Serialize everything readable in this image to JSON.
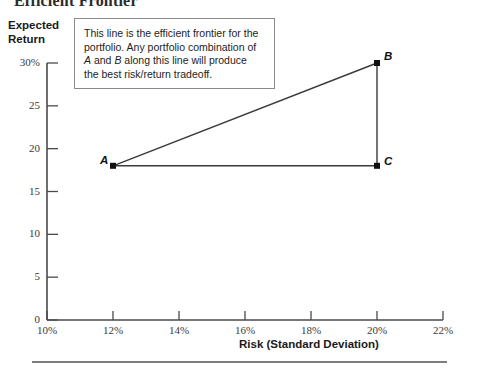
{
  "title": "Efficient Frontier",
  "callout": {
    "lines": [
      "This line is the efficient frontier for the",
      "portfolio. Any portfolio combination of",
      "A and B along this line will produce",
      "the best risk/return tradeoff."
    ],
    "line1": "This line is the efficient frontier for the",
    "line2": "portfolio. Any portfolio combination of",
    "line3_pre": "",
    "line3_a": "A",
    "line3_mid": " and ",
    "line3_b": "B",
    "line3_post": " along this line will produce",
    "line4": "the best risk/return tradeoff."
  },
  "axes": {
    "y_title_line1": "Expected",
    "y_title_line2": "Return",
    "x_title": "Risk (Standard Deviation)"
  },
  "points": {
    "a_label": "A",
    "b_label": "B",
    "c_label": "C"
  },
  "colors": {
    "line": "#3a3a3a",
    "axis": "#4a4a4a",
    "marker": "#111111",
    "box_border": "#8a8a8a",
    "rule": "#7d7d7d",
    "text": "#232323"
  },
  "chart_data": {
    "type": "line",
    "title": "Efficient Frontier",
    "xlabel": "Risk (Standard Deviation)",
    "ylabel": "Expected Return",
    "xlim": [
      10,
      22
    ],
    "ylim": [
      0,
      30
    ],
    "xticks": [
      10,
      12,
      14,
      16,
      18,
      20,
      22
    ],
    "xtick_labels": [
      "10%",
      "12%",
      "14%",
      "16%",
      "18%",
      "20%",
      "22%"
    ],
    "yticks": [
      0,
      5,
      10,
      15,
      20,
      25,
      30
    ],
    "ytick_labels": [
      "0",
      "5",
      "10",
      "15",
      "20",
      "25",
      "30%"
    ],
    "grid": false,
    "legend": null,
    "annotated_points": [
      {
        "label": "A",
        "x": 12,
        "y": 18
      },
      {
        "label": "B",
        "x": 20,
        "y": 30
      },
      {
        "label": "C",
        "x": 20,
        "y": 18
      }
    ],
    "series": [
      {
        "name": "Efficient frontier (A to B)",
        "x": [
          12,
          20
        ],
        "values": [
          18,
          30
        ],
        "style": "solid"
      },
      {
        "name": "Vertical leg (B to C)",
        "x": [
          20,
          20
        ],
        "values": [
          30,
          18
        ],
        "style": "solid"
      },
      {
        "name": "Horizontal leg (A to C)",
        "x": [
          12,
          20
        ],
        "values": [
          18,
          18
        ],
        "style": "solid"
      }
    ],
    "annotations": [
      "This line is the efficient frontier for the portfolio. Any portfolio combination of A and B along this line will produce the best risk/return tradeoff."
    ]
  }
}
